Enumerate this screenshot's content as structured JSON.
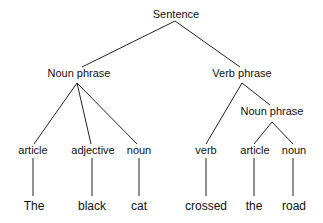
{
  "diagram": {
    "type": "parse-tree",
    "root": "Sentence",
    "nodes": {
      "sentence": "Sentence",
      "noun_phrase_1": "Noun phrase",
      "verb_phrase": "Verb phrase",
      "noun_phrase_2": "Noun phrase",
      "article_1": "article",
      "adjective": "adjective",
      "noun_1": "noun",
      "verb": "verb",
      "article_2": "article",
      "noun_2": "noun"
    },
    "words": [
      "The",
      "black",
      "cat",
      "crossed",
      "the",
      "road"
    ],
    "edges": [
      [
        "Sentence",
        "Noun phrase"
      ],
      [
        "Sentence",
        "Verb phrase"
      ],
      [
        "Noun phrase",
        "article"
      ],
      [
        "Noun phrase",
        "adjective"
      ],
      [
        "Noun phrase",
        "noun"
      ],
      [
        "Verb phrase",
        "verb"
      ],
      [
        "Verb phrase",
        "Noun phrase"
      ],
      [
        "Noun phrase",
        "article"
      ],
      [
        "Noun phrase",
        "noun"
      ],
      [
        "article",
        "The"
      ],
      [
        "adjective",
        "black"
      ],
      [
        "noun",
        "cat"
      ],
      [
        "verb",
        "crossed"
      ],
      [
        "article",
        "the"
      ],
      [
        "noun",
        "road"
      ]
    ]
  }
}
